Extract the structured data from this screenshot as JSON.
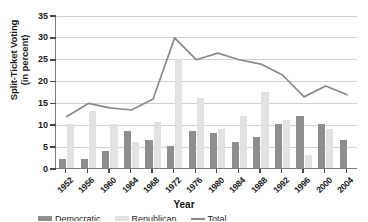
{
  "chart_data": {
    "type": "bar",
    "title": "",
    "xlabel": "Year",
    "ylabel": "Split-Ticket Voting (in percent)",
    "ylabel_line1": "Split-Ticket Voting",
    "ylabel_line2": "(in percent)",
    "ylim": [
      0,
      35
    ],
    "yticks": [
      0,
      5,
      10,
      15,
      20,
      25,
      30,
      35
    ],
    "ytick_labels": [
      "0",
      "5",
      "10",
      "15",
      "20",
      "25",
      "30",
      "35"
    ],
    "grid": true,
    "legend_position": "bottom",
    "categories": [
      "1952",
      "1956",
      "1960",
      "1964",
      "1968",
      "1972",
      "1976",
      "1980",
      "1984",
      "1988",
      "1992",
      "1996",
      "2000",
      "2004"
    ],
    "series": [
      {
        "name": "Democratic",
        "type": "bar",
        "color": "#8e8e8e",
        "values": [
          2,
          2,
          4,
          8.5,
          6.5,
          5,
          8.5,
          8,
          6,
          7,
          10,
          12,
          10,
          6.5
        ]
      },
      {
        "name": "Republican",
        "type": "bar",
        "color": "#e2e2e2",
        "values": [
          10,
          13,
          10,
          6,
          10.5,
          25,
          16,
          9,
          12,
          17.5,
          11,
          3,
          9,
          0
        ]
      },
      {
        "name": "Total Split-Ticket Voting",
        "type": "line",
        "color": "#8a8a8a",
        "values": [
          12,
          15,
          14,
          13.5,
          16,
          30,
          25,
          26.5,
          25,
          24,
          21.5,
          16.5,
          19,
          17
        ]
      }
    ]
  },
  "legend": {
    "items": [
      {
        "label": "Democratic",
        "swatch": "dark"
      },
      {
        "label": "Republican",
        "swatch": "light"
      },
      {
        "label": "Total",
        "swatch": "line"
      }
    ]
  }
}
